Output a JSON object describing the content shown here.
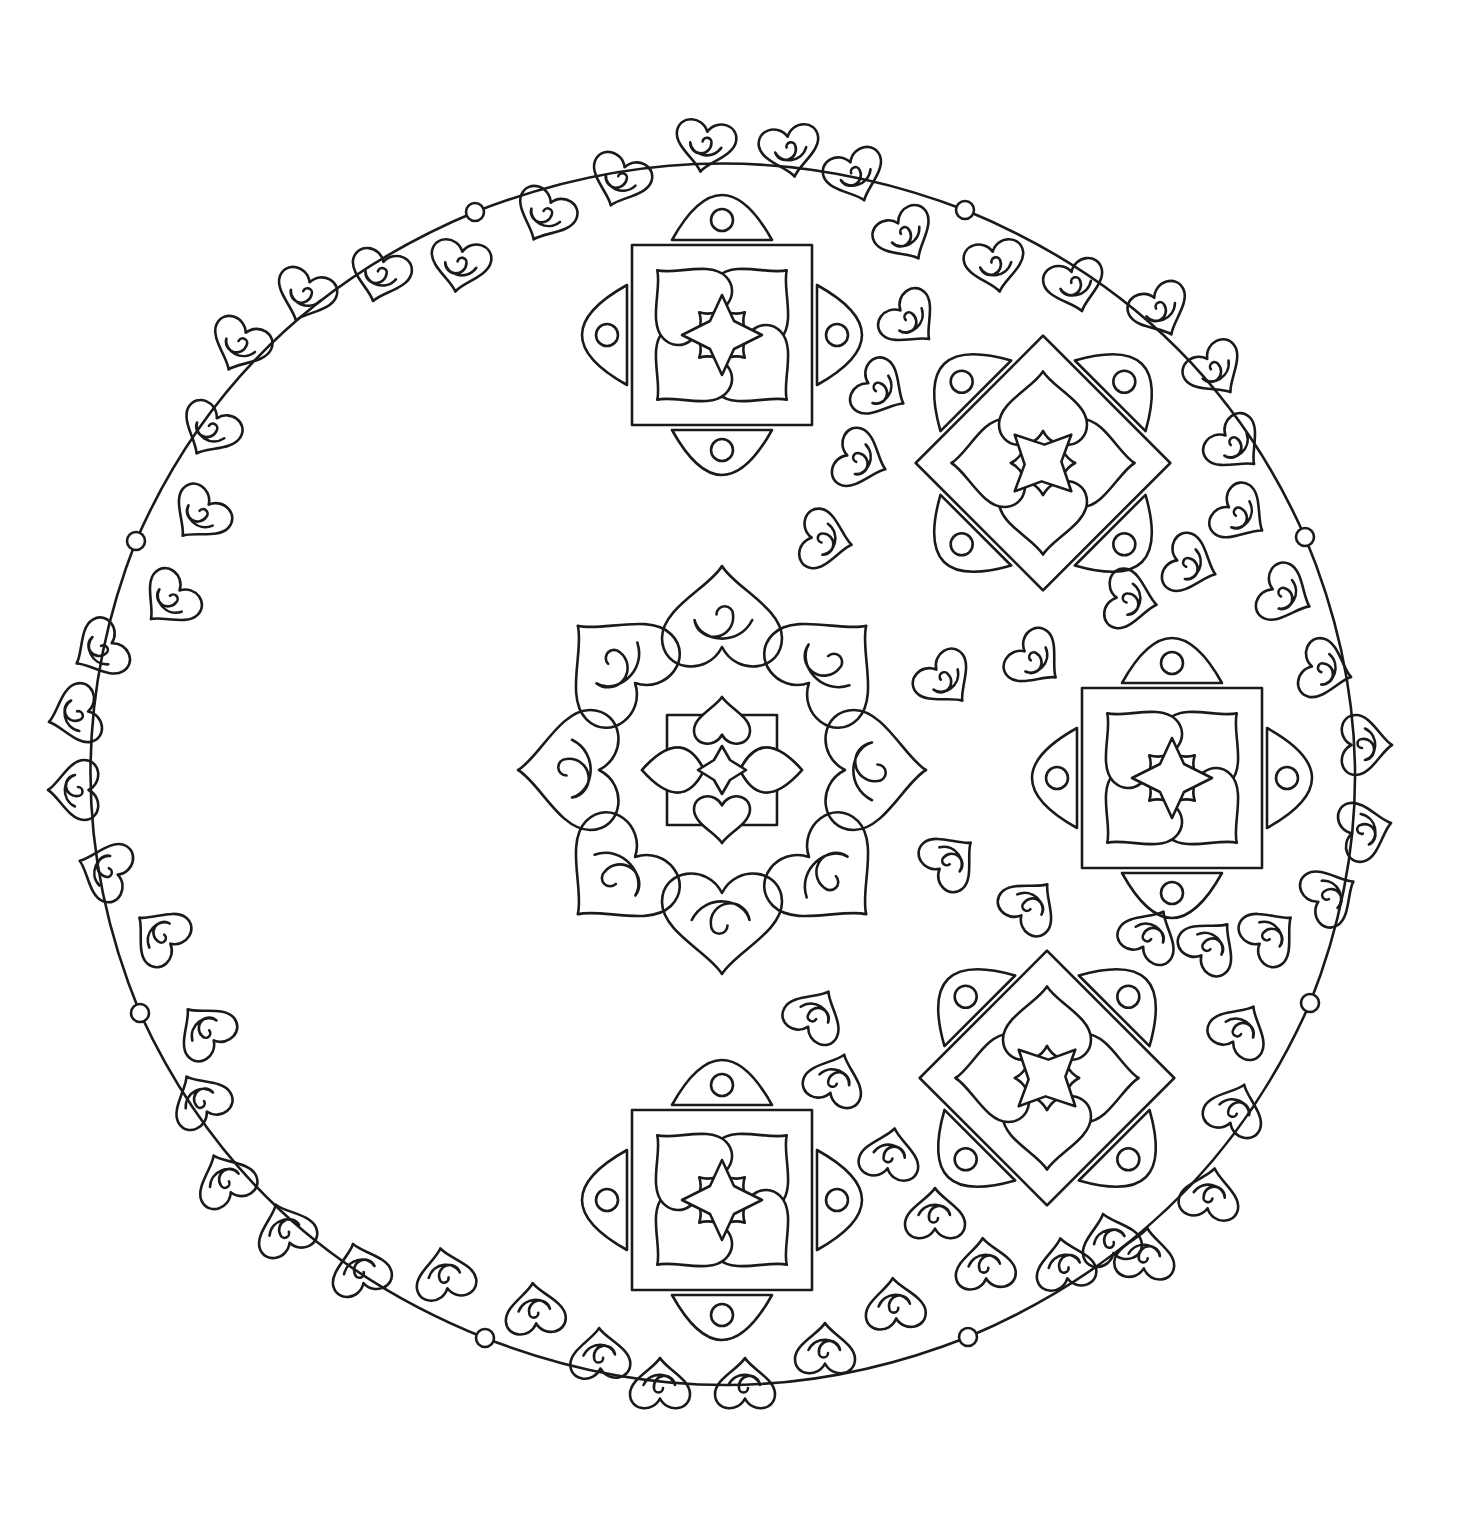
{
  "page": {
    "title": "",
    "background": "#ffffff",
    "line_color": "#1a1a1a"
  },
  "artwork": {
    "type": "mandala-coloring-page",
    "center": [
      722,
      770
    ],
    "border": {
      "shape": "scalloped-8-lobe",
      "joint_dots": [
        [
          475,
          212
        ],
        [
          965,
          210
        ],
        [
          1305,
          537
        ],
        [
          1310,
          1003
        ],
        [
          968,
          1337
        ],
        [
          485,
          1338
        ],
        [
          140,
          1013
        ],
        [
          136,
          541
        ]
      ]
    },
    "center_motif": {
      "cx": 722,
      "cy": 770,
      "hearts": 8
    },
    "flowers": [
      {
        "cx": 722,
        "cy": 335,
        "rot": 0
      },
      {
        "cx": 1043,
        "cy": 463,
        "rot": 45
      },
      {
        "cx": 1172,
        "cy": 778,
        "rot": 0
      },
      {
        "cx": 1047,
        "cy": 1078,
        "rot": 45
      },
      {
        "cx": 722,
        "cy": 1200,
        "rot": 0
      }
    ],
    "small_hearts": [
      [
        705,
        145,
        10
      ],
      [
        790,
        150,
        -10
      ],
      [
        620,
        180,
        20
      ],
      [
        545,
        215,
        25
      ],
      [
        460,
        265,
        10
      ],
      [
        380,
        275,
        15
      ],
      [
        305,
        295,
        20
      ],
      [
        240,
        345,
        25
      ],
      [
        210,
        430,
        30
      ],
      [
        200,
        515,
        40
      ],
      [
        170,
        600,
        45
      ],
      [
        100,
        650,
        60
      ],
      [
        75,
        715,
        75
      ],
      [
        75,
        790,
        90
      ],
      [
        105,
        870,
        110
      ],
      [
        160,
        935,
        130
      ],
      [
        855,
        175,
        -20
      ],
      [
        905,
        235,
        -30
      ],
      [
        910,
        320,
        -45
      ],
      [
        880,
        390,
        -60
      ],
      [
        860,
        460,
        -70
      ],
      [
        825,
        540,
        -80
      ],
      [
        995,
        265,
        -10
      ],
      [
        1075,
        285,
        -15
      ],
      [
        1160,
        310,
        -25
      ],
      [
        1215,
        370,
        -35
      ],
      [
        1235,
        445,
        -45
      ],
      [
        1240,
        515,
        -55
      ],
      [
        1190,
        565,
        -70
      ],
      [
        1130,
        600,
        -80
      ],
      [
        1285,
        595,
        -65
      ],
      [
        1325,
        670,
        -75
      ],
      [
        1365,
        745,
        -90
      ],
      [
        1365,
        830,
        -105
      ],
      [
        1330,
        895,
        -120
      ],
      [
        1270,
        935,
        -130
      ],
      [
        1210,
        945,
        -140
      ],
      [
        1150,
        935,
        -150
      ],
      [
        1240,
        1030,
        -150
      ],
      [
        1235,
        1110,
        -160
      ],
      [
        1210,
        1195,
        -170
      ],
      [
        1145,
        1255,
        -175
      ],
      [
        945,
        680,
        -40
      ],
      [
        1035,
        660,
        -50
      ],
      [
        950,
        860,
        -130
      ],
      [
        1030,
        905,
        -140
      ],
      [
        815,
        1015,
        -150
      ],
      [
        835,
        1080,
        -160
      ],
      [
        890,
        1155,
        -170
      ],
      [
        935,
        1215,
        180
      ],
      [
        985,
        1265,
        175
      ],
      [
        1065,
        1265,
        170
      ],
      [
        1110,
        1240,
        165
      ],
      [
        205,
        1030,
        140
      ],
      [
        200,
        1100,
        150
      ],
      [
        225,
        1180,
        155
      ],
      [
        285,
        1230,
        160
      ],
      [
        360,
        1270,
        165
      ],
      [
        445,
        1275,
        170
      ],
      [
        535,
        1310,
        175
      ],
      [
        600,
        1355,
        178
      ],
      [
        660,
        1385,
        180
      ],
      [
        745,
        1385,
        180
      ],
      [
        825,
        1350,
        180
      ],
      [
        895,
        1305,
        175
      ]
    ]
  }
}
